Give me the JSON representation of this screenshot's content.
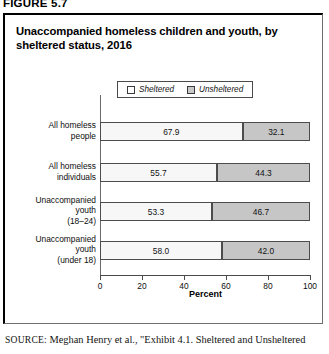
{
  "figure": {
    "label": "FIGURE 5.7",
    "title": "Unaccompanied homeless children and youth, by sheltered status, 2016"
  },
  "legend": {
    "items": [
      {
        "label": "Sheltered",
        "swatch": "legend-swatch-sheltered",
        "color": "#fdfdfd"
      },
      {
        "label": "Unsheltered",
        "swatch": "legend-swatch-unsheltered",
        "color": "#c9c9c9"
      }
    ]
  },
  "source": {
    "kicker": "SOURCE:",
    "text": " Meghan Henry et al., \"Exhibit 4.1. Sheltered and Unsheltered"
  },
  "chart_data": {
    "type": "bar",
    "orientation": "horizontal",
    "stacked": true,
    "title": "Unaccompanied homeless children and youth, by sheltered status, 2016",
    "xlabel": "Percent",
    "ylabel": "",
    "xlim": [
      0,
      100
    ],
    "xticks": [
      0,
      20,
      40,
      60,
      80,
      100
    ],
    "xtick_labels": [
      "0",
      "20",
      "40",
      "60",
      "80",
      "100"
    ],
    "grid": false,
    "legend_position": "top-center",
    "categories": [
      "All homeless people",
      "All homeless individuals",
      "Unaccompanied youth (18–24)",
      "Unaccompanied youth (under 18)"
    ],
    "category_lines": [
      [
        "All homeless",
        "people"
      ],
      [
        "All homeless",
        "individuals"
      ],
      [
        "Unaccompanied",
        "youth",
        "(18–24)"
      ],
      [
        "Unaccompanied",
        "youth",
        "(under 18)"
      ]
    ],
    "series": [
      {
        "name": "Sheltered",
        "values": [
          67.9,
          55.7,
          53.3,
          58.0
        ],
        "labels": [
          "67.9",
          "55.7",
          "53.3",
          "58.0"
        ]
      },
      {
        "name": "Unsheltered",
        "values": [
          32.1,
          44.3,
          46.7,
          42.0
        ],
        "labels": [
          "32.1",
          "44.3",
          "46.7",
          "42.0"
        ]
      }
    ]
  }
}
